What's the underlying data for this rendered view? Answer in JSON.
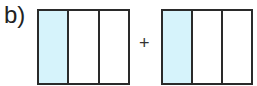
{
  "label": "b)",
  "operator": "+",
  "colors": {
    "shaded": "#d6f3fb",
    "unshaded": "#ffffff",
    "stroke": "#2a2a2a"
  },
  "fractions": [
    {
      "parts": 3,
      "shaded": 1,
      "left": 37,
      "width": 89
    },
    {
      "parts": 3,
      "shaded": 1,
      "left": 161,
      "width": 88
    }
  ]
}
